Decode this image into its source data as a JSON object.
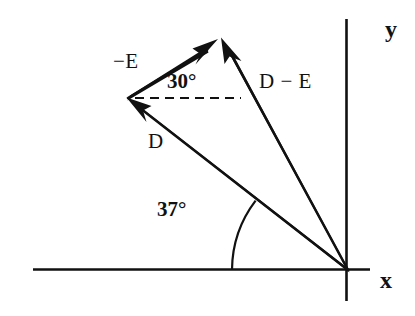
{
  "figure": {
    "background_color": "#ffffff",
    "ink_color": "#111111",
    "width": 415,
    "height": 316
  },
  "axes": {
    "x_label": "x",
    "y_label": "y",
    "origin": {
      "x": 348,
      "y": 270
    },
    "x_axis": {
      "x1": 33,
      "y1": 269,
      "x2": 370,
      "y2": 269
    },
    "y_axis": {
      "x1": 346,
      "y1": 19,
      "x2": 346,
      "y2": 301
    }
  },
  "vectors": [
    {
      "name": "D",
      "label": "D",
      "from": {
        "x": 348,
        "y": 270
      },
      "to": {
        "x": 127,
        "y": 98
      },
      "angle_from_x_axis_deg": 37,
      "arrowhead": "at-tip"
    },
    {
      "name": "minus-E",
      "label": "−E",
      "from": {
        "x": 127,
        "y": 98
      },
      "to": {
        "x": 217,
        "y": 40
      },
      "angle_from_horizontal_deg": 30,
      "arrowhead": "at-tip"
    },
    {
      "name": "D-minus-E",
      "label": "D − E",
      "from": {
        "x": 348,
        "y": 270
      },
      "to": {
        "x": 222,
        "y": 38
      },
      "arrowhead": "at-tip"
    }
  ],
  "angles": [
    {
      "name": "angle-37",
      "label": "37°",
      "value": 37,
      "unit": "degrees",
      "between": [
        "x-axis",
        "D"
      ],
      "vertex": {
        "x": 348,
        "y": 270
      }
    },
    {
      "name": "angle-30",
      "label": "30°",
      "value": 30,
      "unit": "degrees",
      "between": [
        "dashed-horizontal",
        "minus-E"
      ],
      "vertex": {
        "x": 127,
        "y": 98
      }
    }
  ],
  "guides": [
    {
      "name": "dashed-horizontal-reference",
      "style": "dashed",
      "from": {
        "x": 134,
        "y": 98
      },
      "to": {
        "x": 241,
        "y": 98
      }
    }
  ]
}
